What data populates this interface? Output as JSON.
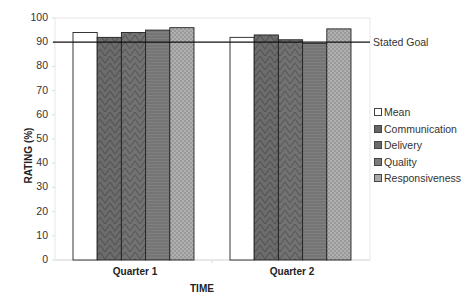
{
  "chart_data": {
    "type": "bar",
    "title": "",
    "xlabel": "TIME",
    "ylabel": "RATING (%)",
    "ylim": [
      0,
      100
    ],
    "yticks": [
      0,
      10,
      20,
      30,
      40,
      50,
      60,
      70,
      80,
      90,
      100
    ],
    "categories": [
      "Quarter 1",
      "Quarter 2"
    ],
    "series": [
      {
        "name": "Mean",
        "values": [
          94,
          92
        ],
        "fill": "#ffffff",
        "pattern": "solid"
      },
      {
        "name": "Communication",
        "values": [
          92,
          93
        ],
        "fill": "#6e6e6e",
        "pattern": "chevron"
      },
      {
        "name": "Delivery",
        "values": [
          94,
          91
        ],
        "fill": "#6a6a6a",
        "pattern": "chevron"
      },
      {
        "name": "Quality",
        "values": [
          95,
          89.5
        ],
        "fill": "#7a7a7a",
        "pattern": "horizontal-lines"
      },
      {
        "name": "Responsiveness",
        "values": [
          96,
          95.5
        ],
        "fill": "#a8a8a8",
        "pattern": "crosshatch-dots"
      }
    ],
    "reference_line": {
      "label": "Stated Goal",
      "value": 90
    },
    "legend_position": "right",
    "grid": false
  },
  "legend": {
    "items": [
      "Mean",
      "Communication",
      "Delivery",
      "Quality",
      "Responsiveness"
    ]
  },
  "axes": {
    "ylabel": "RATING (%)",
    "xlabel": "TIME",
    "categories": [
      "Quarter 1",
      "Quarter 2"
    ],
    "goal_label": "Stated Goal"
  }
}
